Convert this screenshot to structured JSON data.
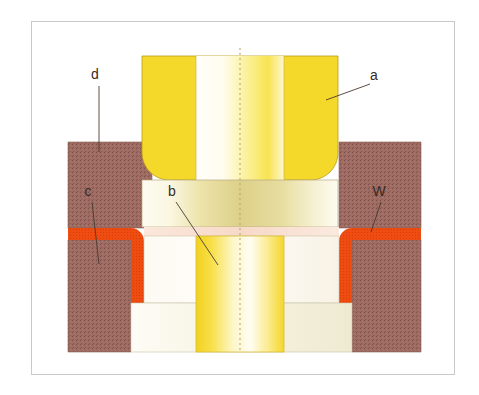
{
  "figure": {
    "type": "cross-section-diagram",
    "canvas": {
      "width": 479,
      "height": 395
    },
    "frame": {
      "x": 31,
      "y": 21,
      "width": 424,
      "height": 354,
      "stroke": "#c9c9c9"
    },
    "symmetry_axis": {
      "x": 240,
      "y_top": 48,
      "y_bottom": 352,
      "style": "dashed",
      "color": "#b9a96a"
    }
  },
  "colors": {
    "background": "#ffffff",
    "frame_border": "#c9c9c9",
    "yellow_plug": "#f5d92a",
    "yellow_plug_light": "#fffdf0",
    "yellow_mid": "#efe6a8",
    "cream": "#fbf8ef",
    "brown_substrate": "#9e6b63",
    "brown_speckle": "#85534c",
    "orange_liner": "#ee4c10",
    "outline": "#8a7a5a",
    "leader_line": "#4a3a30",
    "label_text": "#3a2a22"
  },
  "labels": [
    {
      "id": "label-d",
      "text": "d",
      "text_x": 95,
      "text_y": 79,
      "leader": {
        "x1": 99,
        "y1": 86,
        "x2": 99,
        "y2": 152
      },
      "describes": "upper brown dielectric layer"
    },
    {
      "id": "label-a",
      "text": "a",
      "text_x": 374,
      "text_y": 80,
      "leader": {
        "x1": 370,
        "y1": 84,
        "x2": 326,
        "y2": 100
      },
      "describes": "yellow gate / upper plug material"
    },
    {
      "id": "label-c",
      "text": "c",
      "text_x": 88,
      "text_y": 196,
      "leader": {
        "x1": 92,
        "y1": 202,
        "x2": 99,
        "y2": 264
      },
      "describes": "lower brown substrate region"
    },
    {
      "id": "label-b",
      "text": "b",
      "text_x": 172,
      "text_y": 196,
      "leader": {
        "x1": 176,
        "y1": 202,
        "x2": 218,
        "y2": 265
      },
      "describes": "central yellow contact plug"
    },
    {
      "id": "label-W",
      "text": "W",
      "text_x": 379,
      "text_y": 196,
      "leader": {
        "x1": 381,
        "y1": 202,
        "x2": 371,
        "y2": 232
      },
      "describes": "tungsten conformal liner (orange)"
    }
  ],
  "regions": [
    {
      "id": "upper-brown-left",
      "name": "upper dielectric left",
      "color": "#9e6b63"
    },
    {
      "id": "upper-brown-right",
      "name": "upper dielectric right",
      "color": "#9e6b63"
    },
    {
      "id": "lower-brown-left",
      "name": "lower substrate left",
      "color": "#9e6b63"
    },
    {
      "id": "lower-brown-right",
      "name": "lower substrate right",
      "color": "#9e6b63"
    },
    {
      "id": "orange-liner-left",
      "name": "tungsten liner left",
      "color": "#ee4c10"
    },
    {
      "id": "orange-liner-right",
      "name": "tungsten liner right",
      "color": "#ee4c10"
    },
    {
      "id": "top-plug",
      "name": "upper yellow plug",
      "color": "#f5d92a"
    },
    {
      "id": "mid-band",
      "name": "middle cream band",
      "color": "#efe6a8"
    },
    {
      "id": "trench-fill",
      "name": "trench cream fill",
      "color": "#fbf8ef"
    },
    {
      "id": "center-plug",
      "name": "central yellow plug",
      "color": "#f5d92a"
    },
    {
      "id": "bottom-band",
      "name": "bottom cream band",
      "color": "#f7f3e2"
    }
  ]
}
